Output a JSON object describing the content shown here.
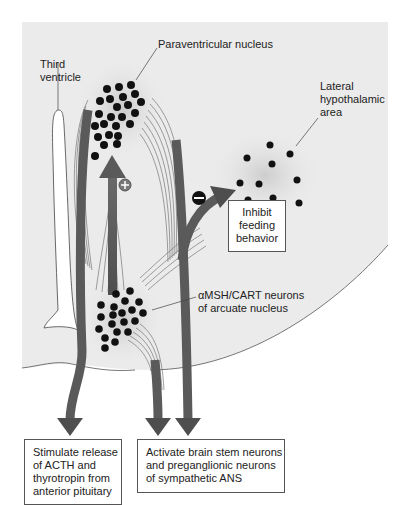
{
  "diagram": {
    "labels": {
      "paraventricular": "Paraventricular nucleus",
      "third_ventricle": "Third\nventricle",
      "lateral_hypothalamic": "Lateral\nhypothalamic\narea",
      "arcuate": "αMSH/CART neurons\nof arcuate nucleus"
    },
    "signs": {
      "plus": "+",
      "minus": "−"
    },
    "boxes": {
      "inhibit": "Inhibit\nfeeding\nbehavior",
      "stimulate": "Stimulate release\nof ACTH and\nthyrotropin from\nanterior pituitary",
      "activate": "Activate brain stem neurons\nand preganglionic neurons\nof sympathetic ANS"
    },
    "colors": {
      "background_region": "#ebebeb",
      "arrow": "#5a5a5a",
      "neuron_dot": "#111111",
      "fiber": "#777777"
    }
  }
}
